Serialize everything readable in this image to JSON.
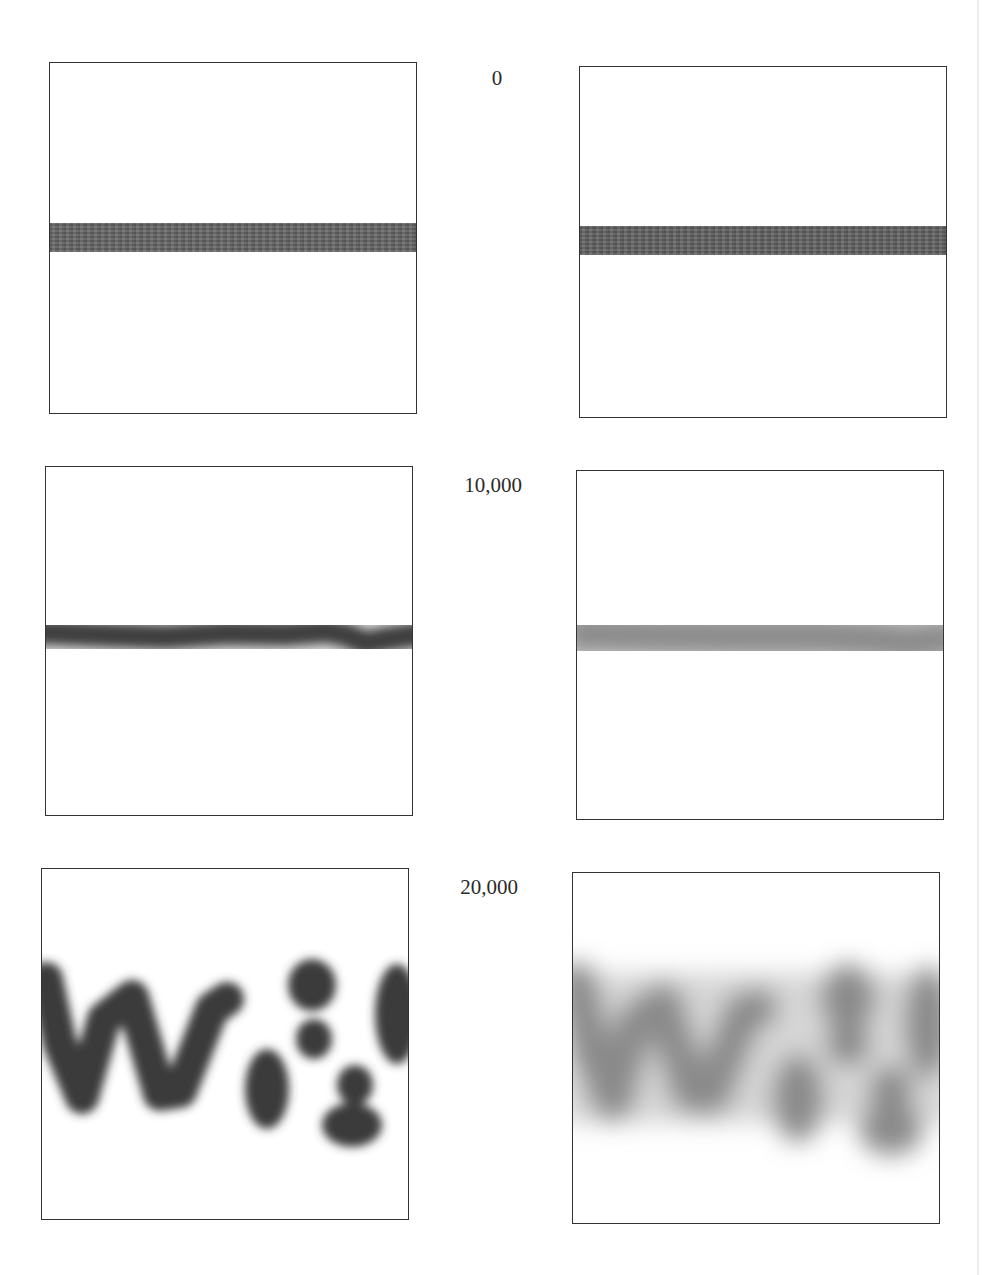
{
  "figure": {
    "columns": 2,
    "rows": [
      {
        "label": "0",
        "left_panel": {
          "pattern": "sharp horizontal stripe",
          "blur": "none",
          "contrast": "high"
        },
        "right_panel": {
          "pattern": "sharp horizontal stripe",
          "blur": "none",
          "contrast": "high"
        }
      },
      {
        "label": "10,000",
        "left_panel": {
          "pattern": "slightly wavy horizontal stripe",
          "blur": "low",
          "contrast": "high"
        },
        "right_panel": {
          "pattern": "slightly wavy horizontal stripe",
          "blur": "high",
          "contrast": "low"
        }
      },
      {
        "label": "20,000",
        "left_panel": {
          "pattern": "W-like zigzag with blobs",
          "blur": "low",
          "contrast": "high"
        },
        "right_panel": {
          "pattern": "W-like zigzag with blobs",
          "blur": "high",
          "contrast": "low"
        }
      }
    ],
    "colors": {
      "frame": "#333333",
      "band_dark": "#5a5a5a",
      "band_faded": "#8a8a8a",
      "background": "#ffffff"
    }
  }
}
